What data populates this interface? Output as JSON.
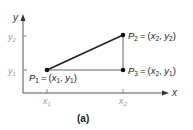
{
  "figure": {
    "caption": "(a)",
    "axes": {
      "x_label": "x",
      "y_label": "y",
      "x_ticks": [
        {
          "base": "x",
          "sub": "1"
        },
        {
          "base": "x",
          "sub": "2"
        }
      ],
      "y_ticks": [
        {
          "base": "y",
          "sub": "2"
        },
        {
          "base": "y",
          "sub": "1"
        }
      ]
    },
    "points": [
      {
        "id": "P1",
        "name": "P",
        "sub": "1",
        "eq": "=",
        "coord_x": "x",
        "coord_x_sub": "1",
        "coord_y": "y",
        "coord_y_sub": "1"
      },
      {
        "id": "P2",
        "name": "P",
        "sub": "2",
        "eq": "=",
        "coord_x": "x",
        "coord_x_sub": "2",
        "coord_y": "y",
        "coord_y_sub": "2"
      },
      {
        "id": "P3",
        "name": "P",
        "sub": "3",
        "eq": "=",
        "coord_x": "x",
        "coord_x_sub": "2",
        "coord_y": "y",
        "coord_y_sub": "1"
      }
    ],
    "colors": {
      "axis": "#555555",
      "tick_label": "#999999",
      "line": "#222222",
      "side_line": "#666666",
      "point": "#111111",
      "text": "#222222"
    }
  }
}
